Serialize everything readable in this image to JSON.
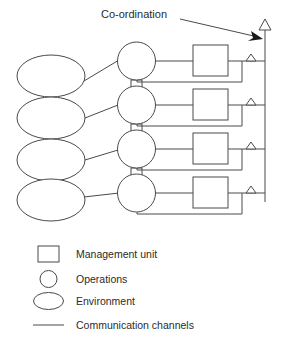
{
  "diagram": {
    "title_label": "Co-ordination",
    "colors": {
      "line": "#4a4a4a",
      "text": "#2b2b2b",
      "arrow_solid": "#1a1a1a",
      "background": "#ffffff",
      "shape_fill": "#ffffff"
    },
    "rows": [
      {
        "index": 1,
        "environment": "Environment",
        "operations": "Operations",
        "management_unit": "Management unit"
      },
      {
        "index": 2,
        "environment": "Environment",
        "operations": "Operations",
        "management_unit": "Management unit"
      },
      {
        "index": 3,
        "environment": "Environment",
        "operations": "Operations",
        "management_unit": "Management unit"
      },
      {
        "index": 4,
        "environment": "Environment",
        "operations": "Operations",
        "management_unit": "Management unit"
      }
    ],
    "annotation": {
      "text": "Co-ordination",
      "arrow": "solid-arrow-right",
      "points_to": "vertical-coordination-spine"
    },
    "spine": {
      "name": "coordination-channel",
      "top_marker": "hollow-triangle-up"
    },
    "feedback_markers": "hollow-chevron-up"
  },
  "legend": {
    "items": [
      {
        "symbol": "square-icon",
        "label": "Management unit"
      },
      {
        "symbol": "circle-icon",
        "label": "Operations"
      },
      {
        "symbol": "ellipse-icon",
        "label": "Environment"
      },
      {
        "symbol": "line-icon",
        "label": "Communication channels"
      }
    ]
  }
}
